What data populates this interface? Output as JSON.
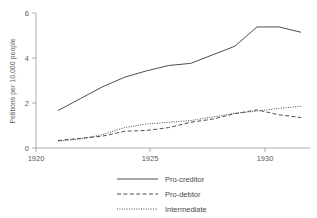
{
  "chart_data": {
    "type": "line",
    "title": "",
    "subtitle": "",
    "xlabel": "",
    "ylabel": "Petitions per 10,000 people",
    "xlim": [
      1920,
      1932.4
    ],
    "ylim": [
      0,
      6.3
    ],
    "xticks": [
      1920,
      1925,
      1930
    ],
    "xticklabels": [
      "1920",
      "1925",
      "1930"
    ],
    "yticks": [
      0,
      2,
      4,
      6
    ],
    "yticklabels": [
      "0",
      "2",
      "4",
      "6"
    ],
    "grid": false,
    "legend_position": "below-center",
    "x": [
      1921,
      1922,
      1923,
      1924,
      1925,
      1926,
      1927,
      1928,
      1929,
      1930,
      1931,
      1932
    ],
    "series": [
      {
        "name": "Pro-creditor",
        "style": "solid",
        "color": "#4d4d4d",
        "values": [
          1.75,
          2.3,
          2.85,
          3.3,
          3.6,
          3.85,
          3.95,
          4.35,
          4.75,
          5.65,
          5.65,
          5.4
        ]
      },
      {
        "name": "Pro-debtor",
        "style": "dashed",
        "color": "#4d4d4d",
        "values": [
          0.35,
          0.45,
          0.55,
          0.78,
          0.82,
          0.95,
          1.2,
          1.35,
          1.6,
          1.78,
          1.55,
          1.42
        ]
      },
      {
        "name": "Intermediate",
        "style": "dotted",
        "color": "#4d4d4d",
        "values": [
          0.32,
          0.42,
          0.62,
          0.95,
          1.12,
          1.2,
          1.28,
          1.45,
          1.62,
          1.72,
          1.85,
          1.95
        ]
      }
    ]
  },
  "axes": {
    "y_title": "Petitions per 10,000 people",
    "y_tick_0": "0",
    "y_tick_2": "2",
    "y_tick_4": "4",
    "y_tick_6": "6",
    "x_tick_1920": "1920",
    "x_tick_1925": "1925",
    "x_tick_1930": "1930"
  },
  "legend": {
    "items": [
      {
        "label": "Pro-creditor",
        "style": "solid"
      },
      {
        "label": "Pro-debtor",
        "style": "dashed"
      },
      {
        "label": "Intermediate",
        "style": "dotted"
      }
    ]
  },
  "colors": {
    "background": "#ffffff",
    "line": "#4d4d4d",
    "axis": "#9a9a9a",
    "text": "#4a4a4a"
  }
}
